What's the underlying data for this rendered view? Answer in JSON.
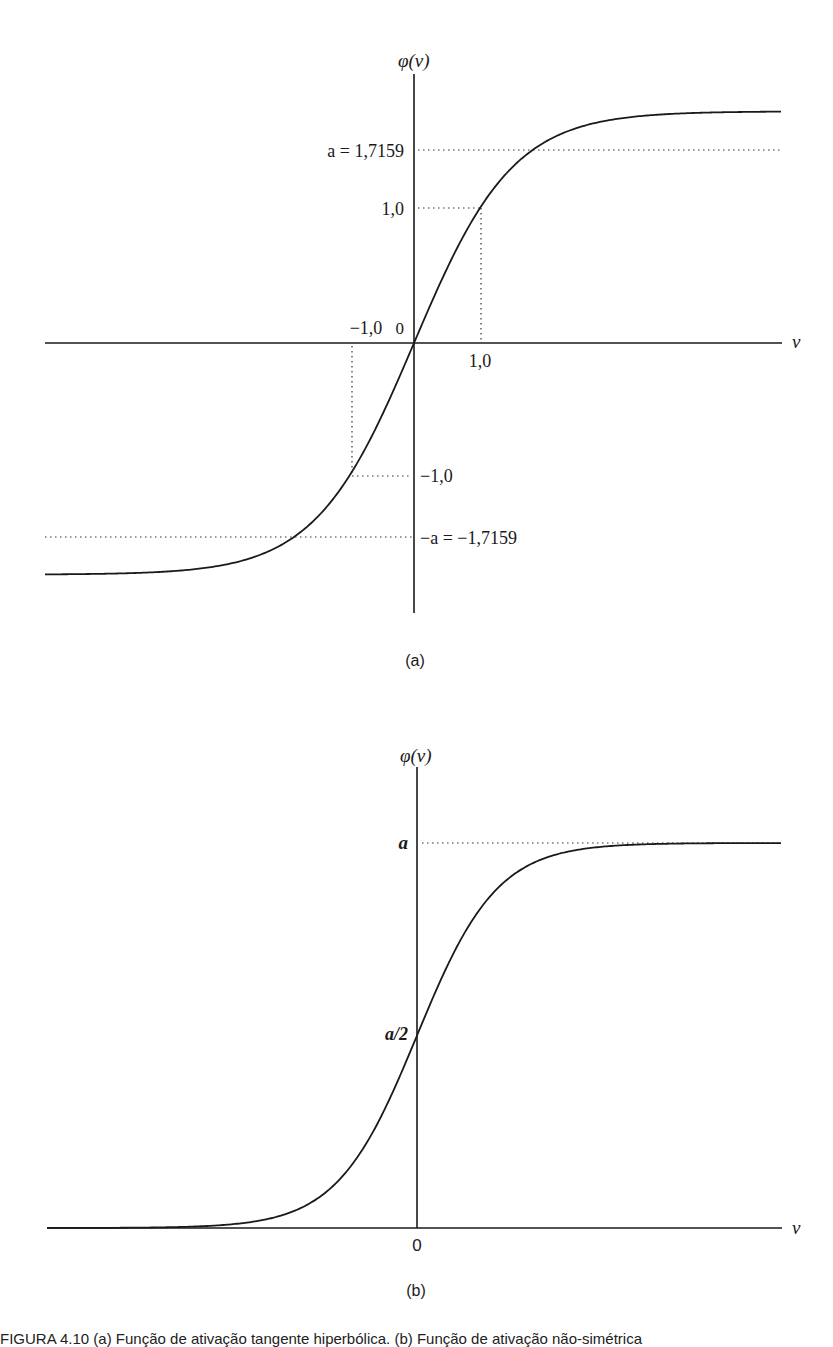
{
  "figure": {
    "panel_a": {
      "y_axis_label": "φ(v)",
      "x_axis_label": "v",
      "origin_label": "0",
      "ytick_a": "a = 1,7159",
      "ytick_1": "1,0",
      "ytick_neg1": "−1,0",
      "ytick_neg_a": "−a = −1,7159",
      "xtick_neg1": "−1,0",
      "xtick_1": "1,0",
      "panel_label": "(a)"
    },
    "panel_b": {
      "y_axis_label": "φ(v)",
      "x_axis_label": "v",
      "origin_label": "0",
      "ytick_a": "a",
      "ytick_half": "a/2",
      "panel_label": "(b)"
    },
    "caption": "FIGURA 4.10  (a) Função de ativação tangente hiperbólica. (b) Função de ativação não-simétrica"
  },
  "chart_data": [
    {
      "type": "line",
      "title": "(a) Hyperbolic tangent activation",
      "function": "phi(v) = a * tanh(b*v), a = 1.7159, b = 2/3",
      "xlabel": "v",
      "ylabel": "φ(v)",
      "xlim": [
        -5.6,
        5.6
      ],
      "ylim": [
        -1.7159,
        1.7159
      ],
      "annotations": [
        "a = 1,7159",
        "1,0",
        "−1,0",
        "−a = −1,7159"
      ],
      "x": [
        -5.6,
        -4,
        -3,
        -2,
        -1,
        0,
        1,
        2,
        3,
        4,
        5.6
      ],
      "values": [
        -1.7137,
        -1.6908,
        -1.6545,
        -1.4967,
        -1.0,
        0.0,
        1.0,
        1.4967,
        1.6545,
        1.6908,
        1.7137
      ],
      "guides": [
        {
          "x": 1.0,
          "y": 1.0
        },
        {
          "x": -1.0,
          "y": -1.0
        }
      ],
      "grid": false
    },
    {
      "type": "line",
      "title": "(b) Non-symmetric (logistic) activation",
      "function": "phi(v) = a / (1 + exp(-k v))",
      "xlabel": "v",
      "ylabel": "φ(v)",
      "ylim": [
        0,
        "a"
      ],
      "annotations": [
        "a",
        "a/2",
        "0"
      ],
      "x": [
        -6,
        -4,
        -2,
        -1,
        0,
        1,
        2,
        4,
        6
      ],
      "values_normalized_to_a": [
        0.0025,
        0.018,
        0.119,
        0.269,
        0.5,
        0.731,
        0.881,
        0.982,
        0.9975
      ],
      "grid": false
    }
  ]
}
